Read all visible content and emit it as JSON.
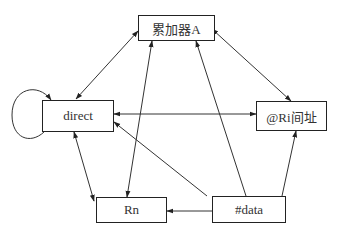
{
  "diagram": {
    "nodes": [
      {
        "id": "acc",
        "label": "累加器A"
      },
      {
        "id": "direct",
        "label": "direct"
      },
      {
        "id": "ri",
        "label": "@Ri间址"
      },
      {
        "id": "rn",
        "label": "Rn"
      },
      {
        "id": "data",
        "label": "#data"
      }
    ],
    "edges": [
      {
        "from": "direct",
        "to": "acc",
        "direction": "both"
      },
      {
        "from": "acc",
        "to": "ri",
        "direction": "both"
      },
      {
        "from": "acc",
        "to": "rn",
        "direction": "both"
      },
      {
        "from": "direct",
        "to": "ri",
        "direction": "both"
      },
      {
        "from": "direct",
        "to": "rn",
        "direction": "both"
      },
      {
        "from": "data",
        "to": "acc",
        "direction": "forward"
      },
      {
        "from": "data",
        "to": "direct",
        "direction": "forward"
      },
      {
        "from": "data",
        "to": "rn",
        "direction": "forward"
      },
      {
        "from": "data",
        "to": "ri",
        "direction": "forward"
      },
      {
        "from": "direct",
        "to": "direct",
        "direction": "self-loop"
      }
    ],
    "line_color": "#333333"
  }
}
